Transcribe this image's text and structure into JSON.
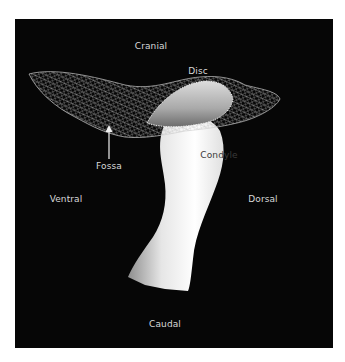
{
  "figure": {
    "background_color": "#060606",
    "bone_color": "#f2f2f2",
    "mesh_color": "#cfcfcf",
    "labels": {
      "cranial": "Cranial",
      "disc": "Disc",
      "fossa": "Fossa",
      "condyle": "Condyle",
      "ventral": "Ventral",
      "dorsal": "Dorsal",
      "caudal": "Caudal"
    }
  }
}
